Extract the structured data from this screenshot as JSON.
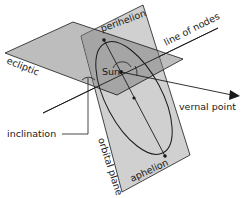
{
  "diagram": {
    "labels": {
      "perihelion": "perihelion",
      "line_of_nodes": "line of nodes",
      "ecliptic": "ecliptic",
      "sun": "Sun",
      "vernal_point": "vernal point",
      "inclination": "inclination",
      "orbital_plane": "orbital plane",
      "aphelion": "aphelion"
    },
    "colors": {
      "ecliptic_fill": "#bdbdbd",
      "orbital_fill": "#c8c8c8",
      "overlap_fill": "#9a9a9a",
      "stroke": "#1a1a1a",
      "background": "#ffffff"
    }
  }
}
